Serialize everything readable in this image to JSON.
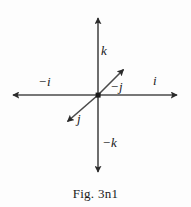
{
  "figure": {
    "caption": "Fig. 3n1",
    "background_color": "#fdfdfd",
    "line_color": "#3a3a3a",
    "text_color": "#1a1a1a",
    "origin": {
      "x": 98,
      "y": 95
    },
    "axes": [
      {
        "name": "k-axis",
        "orientation": "vertical",
        "positive_label": "k",
        "negative_label": "−k",
        "positive_tip": {
          "x": 98,
          "y": 12
        },
        "negative_tip": {
          "x": 98,
          "y": 178
        }
      },
      {
        "name": "i-axis",
        "orientation": "horizontal",
        "positive_label": "i",
        "negative_label": "−i",
        "positive_tip": {
          "x": 183,
          "y": 95
        },
        "negative_tip": {
          "x": 7,
          "y": 95
        }
      },
      {
        "name": "j-axis",
        "orientation": "diagonal",
        "positive_label": "j",
        "negative_label": "−j",
        "positive_tip": {
          "x": 63,
          "y": 126
        },
        "negative_tip": {
          "x": 128,
          "y": 63
        }
      }
    ],
    "labels": {
      "k": "k",
      "neg_k": "−k",
      "i": "i",
      "neg_i": "−i",
      "j": "j",
      "neg_j": "−j"
    }
  }
}
